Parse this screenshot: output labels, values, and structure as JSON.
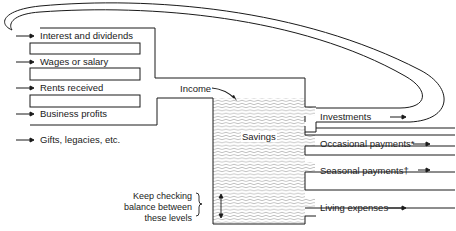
{
  "diagram": {
    "title": "",
    "sources": [
      {
        "label": "Interest and dividends"
      },
      {
        "label": "Wages or salary"
      },
      {
        "label": "Rents received"
      },
      {
        "label": "Business profits"
      },
      {
        "label": "Gifts, legacies, etc."
      }
    ],
    "income_label": "Income",
    "reservoir_label": "Savings",
    "outflows": [
      {
        "label": "Investments"
      },
      {
        "label": "Occasional payments*"
      },
      {
        "label": "Seasonal payments†"
      },
      {
        "label": "Living expenses"
      }
    ],
    "balance_note": [
      "Keep checking",
      "balance between",
      "these levels"
    ],
    "loop": {
      "from": "Investments",
      "to": "Interest and dividends"
    },
    "colors": {
      "line": "#1a1a1a",
      "water": "#8a8a8a",
      "background": "#ffffff"
    }
  }
}
